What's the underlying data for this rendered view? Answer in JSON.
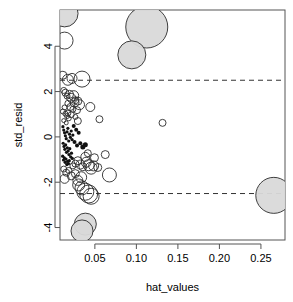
{
  "chart_data": {
    "type": "scatter",
    "title": "",
    "xlabel": "hat_values",
    "ylabel": "std_resid",
    "xlim": [
      0.008,
      0.279
    ],
    "ylim": [
      -4.55,
      5.6
    ],
    "grid": false,
    "legend": null,
    "xticks": [
      0.05,
      0.1,
      0.15,
      0.2,
      0.25
    ],
    "xtick_labels": [
      "0.05",
      "0.10",
      "0.15",
      "0.20",
      "0.25"
    ],
    "yticks": [
      4,
      2,
      0,
      -2,
      -4
    ],
    "ytick_labels": [
      "4",
      "2",
      "0",
      "-2",
      "-4"
    ],
    "reference_lines": [
      {
        "orientation": "horizontal",
        "value": 2.5,
        "style": "dashed"
      },
      {
        "orientation": "horizontal",
        "value": -2.5,
        "style": "dashed"
      }
    ],
    "marker_note": "bubble size encodes Cook's distance; large bubbles shaded grey",
    "points": [
      {
        "x": 0.0135,
        "y": 5.45,
        "r": 13.5,
        "filled": true
      },
      {
        "x": 0.0135,
        "y": 4.25,
        "r": 8.5,
        "filled": false
      },
      {
        "x": 0.1125,
        "y": 4.85,
        "r": 21.0,
        "filled": true
      },
      {
        "x": 0.0945,
        "y": 3.62,
        "r": 14.0,
        "filled": true
      },
      {
        "x": 0.0115,
        "y": 2.72,
        "r": 4.0,
        "filled": false
      },
      {
        "x": 0.0175,
        "y": 2.52,
        "r": 5.5,
        "filled": false
      },
      {
        "x": 0.0225,
        "y": 2.58,
        "r": 5.0,
        "filled": false
      },
      {
        "x": 0.0345,
        "y": 2.55,
        "r": 8.0,
        "filled": false
      },
      {
        "x": 0.0125,
        "y": 2.05,
        "r": 3.0,
        "filled": false
      },
      {
        "x": 0.0145,
        "y": 1.95,
        "r": 3.5,
        "filled": false
      },
      {
        "x": 0.0165,
        "y": 1.8,
        "r": 3.0,
        "filled": false
      },
      {
        "x": 0.0195,
        "y": 1.88,
        "r": 4.0,
        "filled": false
      },
      {
        "x": 0.0215,
        "y": 1.72,
        "r": 4.5,
        "filled": false
      },
      {
        "x": 0.0245,
        "y": 1.82,
        "r": 5.0,
        "filled": false
      },
      {
        "x": 0.0265,
        "y": 1.62,
        "r": 3.5,
        "filled": false
      },
      {
        "x": 0.0295,
        "y": 1.58,
        "r": 4.0,
        "filled": false
      },
      {
        "x": 0.0315,
        "y": 1.42,
        "r": 5.0,
        "filled": false
      },
      {
        "x": 0.0175,
        "y": 1.48,
        "r": 3.0,
        "filled": false
      },
      {
        "x": 0.0205,
        "y": 1.32,
        "r": 3.5,
        "filled": false
      },
      {
        "x": 0.0235,
        "y": 1.22,
        "r": 3.0,
        "filled": false
      },
      {
        "x": 0.0135,
        "y": 1.3,
        "r": 2.5,
        "filled": false
      },
      {
        "x": 0.0115,
        "y": 1.12,
        "r": 2.5,
        "filled": false
      },
      {
        "x": 0.0145,
        "y": 1.02,
        "r": 2.5,
        "filled": false
      },
      {
        "x": 0.0165,
        "y": 0.92,
        "r": 2.5,
        "filled": false
      },
      {
        "x": 0.0185,
        "y": 0.82,
        "r": 2.5,
        "filled": false
      },
      {
        "x": 0.0125,
        "y": 0.72,
        "r": 2.0,
        "filled": false
      },
      {
        "x": 0.0155,
        "y": 0.62,
        "r": 2.0,
        "filled": false
      },
      {
        "x": 0.0215,
        "y": 0.98,
        "r": 3.0,
        "filled": false
      },
      {
        "x": 0.0265,
        "y": 0.88,
        "r": 2.5,
        "filled": false
      },
      {
        "x": 0.0295,
        "y": 0.7,
        "r": 3.5,
        "filled": false
      },
      {
        "x": 0.0115,
        "y": 0.45,
        "r": 1.6,
        "filled": true
      },
      {
        "x": 0.0125,
        "y": 0.3,
        "r": 1.6,
        "filled": true
      },
      {
        "x": 0.0135,
        "y": 0.18,
        "r": 1.6,
        "filled": true
      },
      {
        "x": 0.0145,
        "y": 0.05,
        "r": 1.6,
        "filled": true
      },
      {
        "x": 0.0155,
        "y": -0.08,
        "r": 1.6,
        "filled": true
      },
      {
        "x": 0.0165,
        "y": 0.22,
        "r": 1.6,
        "filled": true
      },
      {
        "x": 0.0175,
        "y": 0.38,
        "r": 1.6,
        "filled": true
      },
      {
        "x": 0.0185,
        "y": -0.18,
        "r": 1.6,
        "filled": true
      },
      {
        "x": 0.0195,
        "y": 0.12,
        "r": 1.6,
        "filled": true
      },
      {
        "x": 0.0205,
        "y": -0.02,
        "r": 1.6,
        "filled": true
      },
      {
        "x": 0.0215,
        "y": 0.26,
        "r": 1.6,
        "filled": true
      },
      {
        "x": 0.0225,
        "y": -0.12,
        "r": 1.6,
        "filled": true
      },
      {
        "x": 0.0235,
        "y": 0.08,
        "r": 1.6,
        "filled": true
      },
      {
        "x": 0.0118,
        "y": -0.28,
        "r": 1.6,
        "filled": true
      },
      {
        "x": 0.0128,
        "y": -0.42,
        "r": 1.6,
        "filled": true
      },
      {
        "x": 0.0138,
        "y": -0.55,
        "r": 1.6,
        "filled": true
      },
      {
        "x": 0.0148,
        "y": -0.35,
        "r": 1.6,
        "filled": true
      },
      {
        "x": 0.0158,
        "y": -0.68,
        "r": 1.6,
        "filled": true
      },
      {
        "x": 0.0168,
        "y": -0.48,
        "r": 1.6,
        "filled": true
      },
      {
        "x": 0.0178,
        "y": -0.62,
        "r": 1.6,
        "filled": true
      },
      {
        "x": 0.0188,
        "y": -0.78,
        "r": 1.6,
        "filled": true
      },
      {
        "x": 0.0198,
        "y": -0.52,
        "r": 1.6,
        "filled": true
      },
      {
        "x": 0.0208,
        "y": -0.88,
        "r": 1.6,
        "filled": true
      },
      {
        "x": 0.0218,
        "y": -0.72,
        "r": 1.6,
        "filled": true
      },
      {
        "x": 0.0228,
        "y": -0.95,
        "r": 1.6,
        "filled": true
      },
      {
        "x": 0.0112,
        "y": -0.85,
        "r": 1.6,
        "filled": true
      },
      {
        "x": 0.0122,
        "y": -1.02,
        "r": 1.6,
        "filled": true
      },
      {
        "x": 0.0132,
        "y": -0.92,
        "r": 1.6,
        "filled": true
      },
      {
        "x": 0.0142,
        "y": -1.12,
        "r": 1.6,
        "filled": true
      },
      {
        "x": 0.0152,
        "y": -0.98,
        "r": 1.6,
        "filled": true
      },
      {
        "x": 0.0162,
        "y": -1.22,
        "r": 1.6,
        "filled": true
      },
      {
        "x": 0.0172,
        "y": -1.08,
        "r": 1.6,
        "filled": true
      },
      {
        "x": 0.0182,
        "y": -1.18,
        "r": 1.6,
        "filled": true
      },
      {
        "x": 0.0192,
        "y": -1.05,
        "r": 1.6,
        "filled": true
      },
      {
        "x": 0.0245,
        "y": 0.48,
        "r": 2.0,
        "filled": true
      },
      {
        "x": 0.0275,
        "y": 0.32,
        "r": 2.0,
        "filled": true
      },
      {
        "x": 0.0305,
        "y": 0.18,
        "r": 2.0,
        "filled": true
      },
      {
        "x": 0.0255,
        "y": -0.22,
        "r": 2.0,
        "filled": true
      },
      {
        "x": 0.0285,
        "y": -0.38,
        "r": 2.0,
        "filled": true
      },
      {
        "x": 0.0325,
        "y": -0.28,
        "r": 2.0,
        "filled": true
      },
      {
        "x": 0.0355,
        "y": -0.45,
        "r": 2.5,
        "filled": true
      },
      {
        "x": 0.0385,
        "y": -0.35,
        "r": 2.5,
        "filled": true
      },
      {
        "x": 0.0235,
        "y": -1.28,
        "r": 3.0,
        "filled": false
      },
      {
        "x": 0.0265,
        "y": -1.18,
        "r": 3.5,
        "filled": false
      },
      {
        "x": 0.0295,
        "y": -1.05,
        "r": 4.0,
        "filled": false
      },
      {
        "x": 0.0325,
        "y": -1.22,
        "r": 4.5,
        "filled": false
      },
      {
        "x": 0.0355,
        "y": -1.32,
        "r": 4.0,
        "filled": false
      },
      {
        "x": 0.0395,
        "y": -1.12,
        "r": 5.0,
        "filled": false
      },
      {
        "x": 0.0425,
        "y": -1.25,
        "r": 5.5,
        "filled": false
      },
      {
        "x": 0.0455,
        "y": -1.38,
        "r": 6.0,
        "filled": false
      },
      {
        "x": 0.0485,
        "y": -1.28,
        "r": 5.0,
        "filled": false
      },
      {
        "x": 0.0385,
        "y": -0.88,
        "r": 4.5,
        "filled": false
      },
      {
        "x": 0.0415,
        "y": -0.72,
        "r": 3.5,
        "filled": false
      },
      {
        "x": 0.0125,
        "y": -1.42,
        "r": 3.0,
        "filled": false
      },
      {
        "x": 0.0155,
        "y": -1.58,
        "r": 3.5,
        "filled": false
      },
      {
        "x": 0.0185,
        "y": -1.48,
        "r": 3.0,
        "filled": false
      },
      {
        "x": 0.0215,
        "y": -1.72,
        "r": 4.0,
        "filled": false
      },
      {
        "x": 0.0135,
        "y": -1.85,
        "r": 4.5,
        "filled": false
      },
      {
        "x": 0.0265,
        "y": -1.62,
        "r": 4.0,
        "filled": false
      },
      {
        "x": 0.0295,
        "y": -1.92,
        "r": 5.0,
        "filled": false
      },
      {
        "x": 0.0335,
        "y": -1.78,
        "r": 5.5,
        "filled": false
      },
      {
        "x": 0.0305,
        "y": -2.12,
        "r": 6.0,
        "filled": false
      },
      {
        "x": 0.0345,
        "y": -2.25,
        "r": 7.0,
        "filled": false
      },
      {
        "x": 0.0385,
        "y": -2.42,
        "r": 8.5,
        "filled": false
      },
      {
        "x": 0.0425,
        "y": -2.52,
        "r": 9.0,
        "filled": false
      },
      {
        "x": 0.0455,
        "y": -2.62,
        "r": 8.0,
        "filled": false
      },
      {
        "x": 0.0675,
        "y": -1.68,
        "r": 7.0,
        "filled": false
      },
      {
        "x": 0.0535,
        "y": -1.35,
        "r": 4.0,
        "filled": false
      },
      {
        "x": 0.0495,
        "y": -0.92,
        "r": 4.0,
        "filled": false
      },
      {
        "x": 0.1315,
        "y": 0.62,
        "r": 3.5,
        "filled": false
      },
      {
        "x": 0.0385,
        "y": -3.85,
        "r": 11.0,
        "filled": true
      },
      {
        "x": 0.0345,
        "y": -4.15,
        "r": 11.0,
        "filled": true
      },
      {
        "x": 0.2655,
        "y": -2.58,
        "r": 18.0,
        "filled": true
      },
      {
        "x": 0.0175,
        "y": 1.05,
        "r": 3.0,
        "filled": false
      },
      {
        "x": 0.0255,
        "y": 1.52,
        "r": 4.5,
        "filled": false
      },
      {
        "x": 0.0285,
        "y": 1.18,
        "r": 3.5,
        "filled": false
      },
      {
        "x": 0.0445,
        "y": 1.32,
        "r": 4.5,
        "filled": false
      },
      {
        "x": 0.0555,
        "y": 0.78,
        "r": 3.5,
        "filled": false
      },
      {
        "x": 0.0625,
        "y": -0.78,
        "r": 4.0,
        "filled": false
      }
    ]
  }
}
